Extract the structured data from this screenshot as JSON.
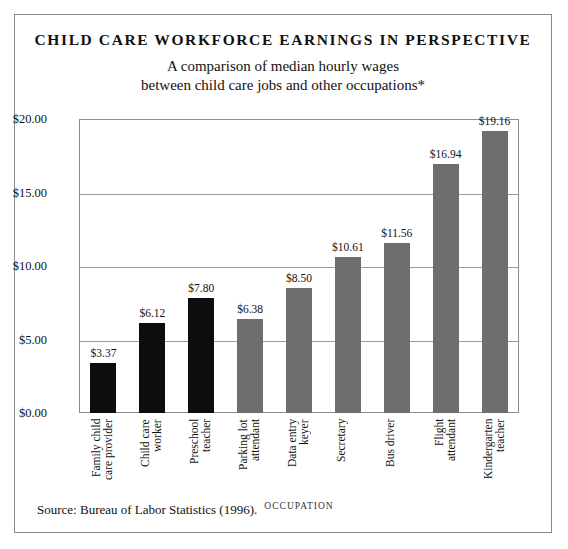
{
  "title": "CHILD CARE WORKFORCE EARNINGS IN PERSPECTIVE",
  "subtitle_line1": "A comparison of median hourly wages",
  "subtitle_line2": "between child care jobs and other occupations*",
  "source": "Source: Bureau of Labor Statistics (1996).",
  "colors": {
    "child_care_bar": "#0d0d0d",
    "other_occupation_bar": "#6e6e6e",
    "frame": "#8a8a8a",
    "gridline": "#9a9a9a"
  },
  "chart_data": {
    "type": "bar",
    "title": "CHILD CARE WORKFORCE EARNINGS IN PERSPECTIVE",
    "subtitle": "A comparison of median hourly wages between child care jobs and other occupations*",
    "xlabel": "OCCUPATION",
    "ylabel": "",
    "ylim": [
      0,
      20
    ],
    "yticks": [
      0,
      5,
      10,
      15,
      20
    ],
    "ytick_labels": [
      "$0.00",
      "$5.00",
      "$10.00",
      "$15.00",
      "$20.00"
    ],
    "grid": true,
    "legend": "none",
    "categories": [
      "Family child care provider",
      "Child care worker",
      "Preschool teacher",
      "Parking lot attendant",
      "Data entry keyer",
      "Secretary",
      "Bus driver",
      "Flight attendant",
      "Kindergarten teacher"
    ],
    "values": [
      3.37,
      6.12,
      7.8,
      6.38,
      8.5,
      10.61,
      11.56,
      16.94,
      19.16
    ],
    "value_labels": [
      "$3.37",
      "$6.12",
      "$7.80",
      "$6.38",
      "$8.50",
      "$10.61",
      "$11.56",
      "$16.94",
      "$19.16"
    ],
    "group": [
      "child-care",
      "child-care",
      "child-care",
      "other",
      "other",
      "other",
      "other",
      "other",
      "other"
    ],
    "category_lines": [
      [
        "Family child",
        "care provider"
      ],
      [
        "Child care",
        "worker"
      ],
      [
        "Preschool",
        "teacher"
      ],
      [
        "Parking lot",
        "attendant"
      ],
      [
        "Data entry",
        "keyer"
      ],
      [
        "Secretary"
      ],
      [
        "Bus driver"
      ],
      [
        "Flight",
        "attendant"
      ],
      [
        "Kindergarten",
        "teacher"
      ]
    ]
  }
}
